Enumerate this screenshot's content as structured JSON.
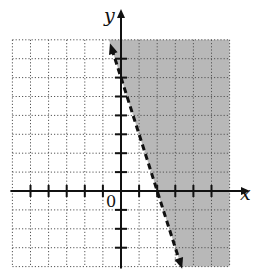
{
  "chart_data": {
    "type": "line",
    "title": "",
    "xlabel": "x",
    "ylabel": "y",
    "origin_label": "0",
    "xlim": [
      -6,
      6
    ],
    "ylim": [
      -4,
      8
    ],
    "grid": true,
    "grid_style": "dotted",
    "x_ticks": [
      -5,
      -4,
      -3,
      -2,
      -1,
      1,
      2,
      3,
      4,
      5
    ],
    "y_ticks": [
      -3,
      -2,
      -1,
      1,
      2,
      3,
      4,
      5,
      6,
      7
    ],
    "boundary_line": {
      "equation": "y = -3x + 6",
      "slope": -3,
      "intercept": 6,
      "style": "dashed",
      "arrows": "both",
      "x_intercept": 2,
      "y_intercept": 6
    },
    "inequality": "y > -3x + 6",
    "shaded_region": "right of / above the dashed line",
    "shade_color": "#b8b8b8"
  }
}
